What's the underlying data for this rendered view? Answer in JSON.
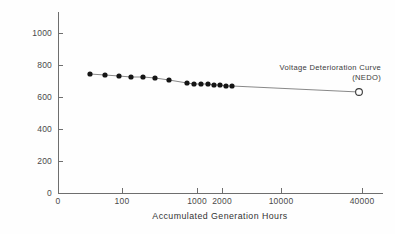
{
  "chart_data": {
    "type": "line",
    "title": "",
    "xlabel": "Accumulated Generation Hours",
    "ylabel": "Average Cell Voltage/mV",
    "grid": false,
    "legend": "none",
    "annotations": [
      {
        "name": "voltage-deterioration-curve-annotation",
        "line1": "Voltage Deterioration Curve",
        "line2": "(NEDO)"
      }
    ],
    "x_ticks": [
      {
        "label": "0",
        "value": 0,
        "px": 58
      },
      {
        "label": "100",
        "value": 100,
        "px": 122
      },
      {
        "label": "1000",
        "value": 1000,
        "px": 197
      },
      {
        "label": "2000",
        "value": 2000,
        "px": 222
      },
      {
        "label": "10000",
        "value": 10000,
        "px": 281
      },
      {
        "label": "40000",
        "value": 40000,
        "px": 362
      }
    ],
    "y_ticks": [
      {
        "label": "0",
        "value": 0,
        "px": 193
      },
      {
        "label": "200",
        "value": 200,
        "px": 161
      },
      {
        "label": "400",
        "value": 400,
        "px": 129
      },
      {
        "label": "600",
        "value": 600,
        "px": 97
      },
      {
        "label": "800",
        "value": 800,
        "px": 65
      },
      {
        "label": "1000",
        "value": 1000,
        "px": 33
      }
    ],
    "ylim": [
      0,
      1070
    ],
    "xlim_px": [
      58,
      383
    ],
    "series": [
      {
        "name": "average-cell-voltage",
        "marker": "filled-circle",
        "x": [
          430,
          700,
          950,
          1100,
          1250,
          1450,
          1900,
          2150,
          2400,
          2700,
          3000,
          3300,
          3650,
          4000,
          4400,
          40000
        ],
        "y": [
          724,
          719,
          715,
          712,
          710,
          707,
          692,
          683,
          680,
          678,
          676,
          674,
          672,
          670,
          668,
          556
        ],
        "points_px": [
          {
            "x": 90,
            "y": 74
          },
          {
            "x": 105,
            "y": 75
          },
          {
            "x": 119,
            "y": 76
          },
          {
            "x": 131,
            "y": 77
          },
          {
            "x": 143,
            "y": 77
          },
          {
            "x": 155,
            "y": 78
          },
          {
            "x": 169,
            "y": 80
          },
          {
            "x": 187,
            "y": 83
          },
          {
            "x": 194,
            "y": 84
          },
          {
            "x": 201,
            "y": 84
          },
          {
            "x": 208,
            "y": 84
          },
          {
            "x": 214,
            "y": 85
          },
          {
            "x": 220,
            "y": 85
          },
          {
            "x": 226,
            "y": 86
          },
          {
            "x": 232,
            "y": 86
          },
          {
            "x": 359,
            "y": 92
          }
        ],
        "last_point_marker": "open-circle"
      }
    ]
  }
}
